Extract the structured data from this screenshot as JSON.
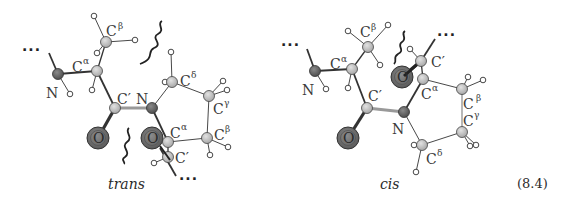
{
  "figure": {
    "equation_number": "(8.4)",
    "colors": {
      "carbon": "#bdbdbd",
      "nitrogen": "#6f6f6f",
      "oxygen": "#7a7a7a",
      "hydrogen": "#ffffff",
      "bond": "#333333",
      "peptide_bond": "#9a9a9a"
    }
  },
  "trans": {
    "caption": "trans",
    "chain_dots_start": "···",
    "chain_dots_end": "···",
    "labels": {
      "n1": "N",
      "ca1": "C",
      "ca1_sup": "α",
      "cb1": "C",
      "cb1_sup": "β",
      "cp1": "C′",
      "n2": "N",
      "o1": "O",
      "o2": "O",
      "cd": "C",
      "cd_sup": "δ",
      "cg": "C",
      "cg_sup": "γ",
      "cb2": "C",
      "cb2_sup": "β",
      "ca2": "C",
      "ca2_sup": "α",
      "cp2": "C′"
    }
  },
  "cis": {
    "caption": "cis",
    "chain_dots_start": "···",
    "chain_dots_end": "···",
    "labels": {
      "n1": "N",
      "ca1": "C",
      "ca1_sup": "α",
      "cb1": "C",
      "cb1_sup": "β",
      "cp1": "C′",
      "n2": "N",
      "o1": "O",
      "o2": "O",
      "cp2": "C′",
      "ca2": "C",
      "ca2_sup": "α",
      "cb2": "C",
      "cb2_sup": "β",
      "cg": "C",
      "cg_sup": "γ",
      "cd": "C",
      "cd_sup": "δ"
    }
  }
}
